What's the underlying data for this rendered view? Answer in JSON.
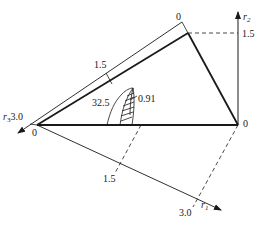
{
  "diagram": {
    "type": "ternary-style triangle diagram with three radial axes",
    "axes": {
      "r1": {
        "name": "r",
        "subscript": "1",
        "ticks": [
          "1.5",
          "3.0"
        ]
      },
      "r2": {
        "name": "r",
        "subscript": "2",
        "ticks": [
          "1.5"
        ]
      },
      "r3": {
        "name": "r",
        "subscript": "3",
        "ticks": [
          "1.5",
          "3.0"
        ]
      }
    },
    "vertex_labels": {
      "left": "0",
      "right": "0",
      "top_axis_zero": "0"
    },
    "annotations": {
      "angle_value": "32.5",
      "ratio_value": "0.91"
    },
    "colors": {
      "line": "#1a1a1a",
      "background": "#ffffff"
    }
  }
}
